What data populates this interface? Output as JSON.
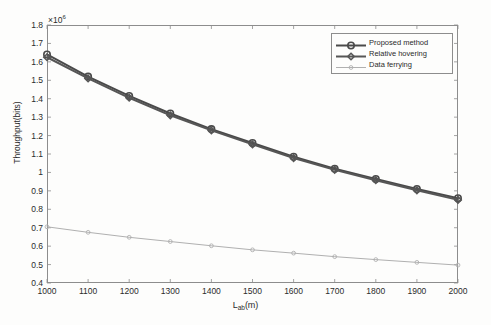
{
  "chart_data": {
    "type": "line",
    "title": "",
    "xlabel": "L_ab(m)",
    "xlabel_base": "L",
    "xlabel_sub": "ab",
    "xlabel_tail": "(m)",
    "ylabel": "Throughput(bits)",
    "y_exponent_prefix": "×10",
    "y_exponent_power": "6",
    "y_exponent_full": "×10⁶",
    "xlim": [
      1000,
      2000
    ],
    "ylim": [
      0.4,
      1.8
    ],
    "grid": false,
    "legend_position": "upper-right",
    "x": [
      1000,
      1100,
      1200,
      1300,
      1400,
      1500,
      1600,
      1700,
      1800,
      1900,
      2000
    ],
    "xticklabels": [
      "1000",
      "1100",
      "1200",
      "1300",
      "1400",
      "1500",
      "1600",
      "1700",
      "1800",
      "1900",
      "2000"
    ],
    "yticklabels": [
      "1.8",
      "1.7",
      "1.6",
      "1.5",
      "1.4",
      "1.3",
      "1.2",
      "1.1",
      "1",
      "0.9",
      "0.8",
      "0.7",
      "0.6",
      "0.5",
      "0.4"
    ],
    "ytickvalues": [
      1.8,
      1.7,
      1.6,
      1.5,
      1.4,
      1.3,
      1.2,
      1.1,
      1.0,
      0.9,
      0.8,
      0.7,
      0.6,
      0.5,
      0.4
    ],
    "series": [
      {
        "name": "Proposed method",
        "color": "#4a4a4a",
        "marker": "circle",
        "linewidth": 2.0,
        "values": [
          1.64,
          1.52,
          1.415,
          1.32,
          1.235,
          1.16,
          1.085,
          1.02,
          0.965,
          0.91,
          0.86
        ]
      },
      {
        "name": "Relative hovering",
        "color": "#565656",
        "marker": "diamond",
        "linewidth": 2.0,
        "values": [
          1.625,
          1.51,
          1.405,
          1.31,
          1.228,
          1.152,
          1.078,
          1.014,
          0.958,
          0.903,
          0.851
        ]
      },
      {
        "name": "Data ferrying",
        "color": "#b0b0b0",
        "marker": "circle-small",
        "linewidth": 1.0,
        "values": [
          0.705,
          0.675,
          0.648,
          0.625,
          0.602,
          0.58,
          0.562,
          0.543,
          0.527,
          0.512,
          0.497
        ]
      }
    ]
  },
  "legend": {
    "items": [
      {
        "label": "Proposed method"
      },
      {
        "label": "Relative hovering"
      },
      {
        "label": "Data ferrying"
      }
    ]
  }
}
